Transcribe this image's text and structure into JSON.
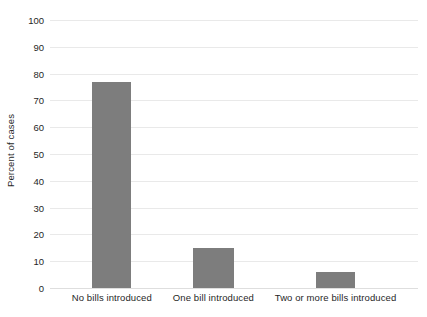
{
  "chart_data": {
    "type": "bar",
    "title": "",
    "xlabel": "",
    "ylabel": "Percent of cases",
    "categories": [
      "No bills introduced",
      "One bill introduced",
      "Two or more bills introduced"
    ],
    "values": [
      77,
      15,
      6
    ],
    "ylim": [
      0,
      100
    ],
    "ytick_labels": [
      "100",
      "90",
      "80",
      "70",
      "60",
      "50",
      "40",
      "30",
      "20",
      "10",
      "0"
    ],
    "ytick_values": [
      100,
      90,
      80,
      70,
      60,
      50,
      40,
      30,
      20,
      10,
      0
    ],
    "grid": true,
    "grid_axis": "y",
    "legend": null,
    "legend_position": "none",
    "colors": {
      "bar": "#7d7d7d",
      "gridline": "#e9e9e9",
      "background": "#ffffff",
      "text": "#1f1f1f"
    },
    "bar_geometry": [
      {
        "center_pct": 16.8,
        "width_pct": 10.6
      },
      {
        "center_pct": 44.4,
        "width_pct": 11.1
      },
      {
        "center_pct": 77.6,
        "width_pct": 10.6
      }
    ]
  }
}
